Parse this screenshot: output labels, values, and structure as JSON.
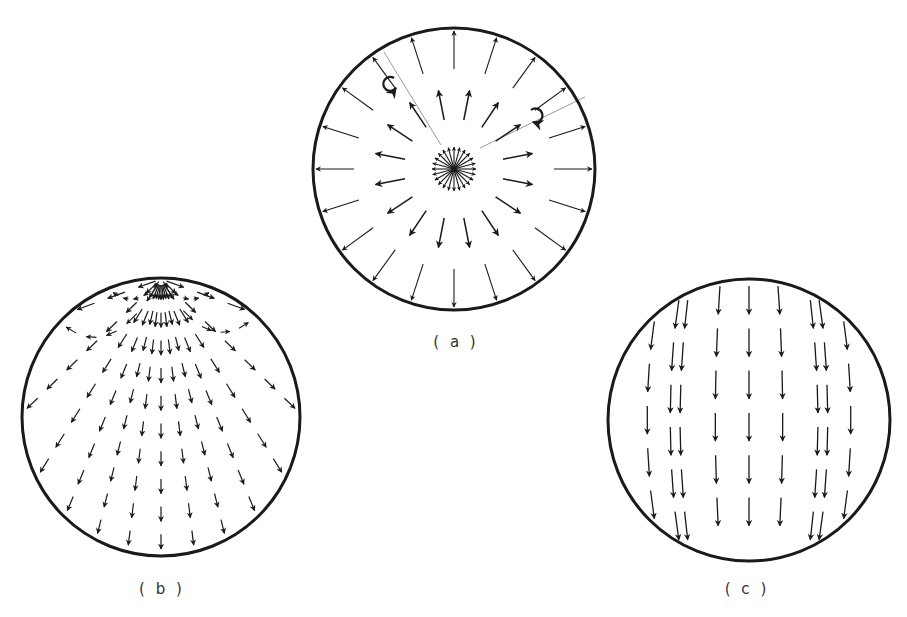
{
  "figure": {
    "type": "vector-field-diagrams",
    "ink_color": "#1a1a1a",
    "faint_ink_color": "#9a9a9a",
    "background": "#ffffff",
    "panels": [
      {
        "id": "a",
        "label": "( a )",
        "description": "Radial outward field from central source with two rotation markers",
        "circle": {
          "cx": 454,
          "cy": 169,
          "r": 141
        },
        "label_pos": {
          "x": 456,
          "y": 333
        },
        "field": "radial",
        "rings": [
          {
            "r_start": 0,
            "r_end": 22,
            "count": 24,
            "head": 4
          },
          {
            "r_start": 50,
            "r_end": 80,
            "count": 16,
            "head": 5
          },
          {
            "r_start": 100,
            "r_end": 138,
            "count": 20,
            "head": 4
          }
        ],
        "rotation_markers": [
          {
            "x": 388,
            "y": 84,
            "dir": "ccw"
          },
          {
            "x": 537,
            "y": 117,
            "dir": "cw"
          }
        ],
        "guide_lines": [
          {
            "x1": 441,
            "y1": 145,
            "x2": 384,
            "y2": 52
          },
          {
            "x1": 480,
            "y1": 148,
            "x2": 585,
            "y2": 97
          }
        ]
      },
      {
        "id": "b",
        "label": "( b )",
        "description": "Field lines diverging from a point source at the top of the circle",
        "circle": {
          "cx": 161,
          "cy": 417,
          "r": 139
        },
        "label_pos": {
          "x": 162,
          "y": 580
        },
        "field": "point-source-top",
        "source": {
          "x": 161,
          "y": 279
        },
        "line_angles_deg": [
          90,
          97,
          104,
          112,
          122,
          136,
          160,
          83,
          76,
          68,
          58,
          44,
          20
        ],
        "arcs": [
          {
            "side": "left",
            "end": {
              "x": 110,
              "y": 290
            }
          },
          {
            "side": "right",
            "end": {
              "x": 212,
              "y": 290
            }
          },
          {
            "side": "left",
            "end": {
              "x": 60,
              "y": 322
            }
          },
          {
            "side": "right",
            "end": {
              "x": 254,
              "y": 318
            }
          }
        ]
      },
      {
        "id": "c",
        "label": "( c )",
        "description": "Uniform-to-bulging downward field lines spanning the circle",
        "circle": {
          "cx": 749,
          "cy": 420,
          "r": 141
        },
        "label_pos": {
          "x": 747,
          "y": 580
        },
        "field": "downward-dipole",
        "columns": [
          -0.88,
          -0.68,
          -0.45,
          -0.22,
          0,
          0.22,
          0.45,
          0.68,
          0.88
        ],
        "bulge": 0.18
      }
    ]
  }
}
